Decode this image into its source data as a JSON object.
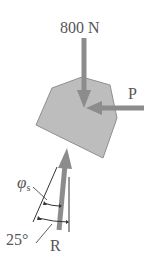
{
  "diagram": {
    "type": "free-body force diagram",
    "body": {
      "shape": "irregular polygon block",
      "fill": "#bdbdbd",
      "stroke": "#8a8a8a"
    },
    "forces": [
      {
        "id": "weight",
        "label": "800 N",
        "direction": "down",
        "color": "#8c8c8c"
      },
      {
        "id": "push",
        "label": "P",
        "direction": "left (horizontal)",
        "color": "#8c8c8c"
      },
      {
        "id": "reaction",
        "label": "R",
        "direction": "up, tilted",
        "color": "#8c8c8c"
      }
    ],
    "angles": [
      {
        "id": "friction-angle",
        "label": "φ",
        "subscript": "s"
      },
      {
        "id": "incline-angle",
        "label": "25°"
      }
    ]
  },
  "labels": {
    "weight": "800 N",
    "push": "P",
    "reaction": "R",
    "phi": "φ",
    "phi_sub": "s",
    "angle": "25°"
  }
}
